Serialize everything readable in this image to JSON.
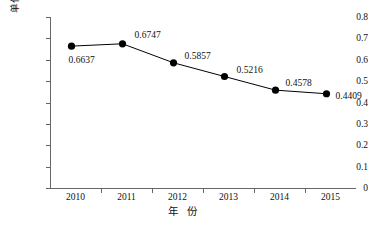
{
  "chart_data": {
    "type": "line",
    "title": "",
    "xlabel": "年 份",
    "ylabel": "单位产值SO2排放量/(kg/万元)",
    "ylabel_parts": {
      "prefix": "单位产值SO",
      "sub": "2",
      "suffix": "排放量/(kg/万元)"
    },
    "categories": [
      "2010",
      "2011",
      "2012",
      "2013",
      "2014",
      "2015"
    ],
    "values": [
      0.6637,
      0.6747,
      0.5857,
      0.5216,
      0.4578,
      0.4409
    ],
    "point_labels": [
      "0.6637",
      "0.6747",
      "0.5857",
      "0.5216",
      "0.4578",
      "0.4409"
    ],
    "ylim": [
      0,
      0.8
    ],
    "ytick_labels": [
      "0",
      "0.1",
      "0.2",
      "0.3",
      "0.4",
      "0.5",
      "0.6",
      "0.7",
      "0.8"
    ],
    "ytick_values": [
      0,
      0.1,
      0.2,
      0.3,
      0.4,
      0.5,
      0.6,
      0.7,
      0.8
    ],
    "grid": false,
    "legend": "none",
    "marker": "filled-circle",
    "series_color": "#000000",
    "axis_color": "#666666"
  }
}
